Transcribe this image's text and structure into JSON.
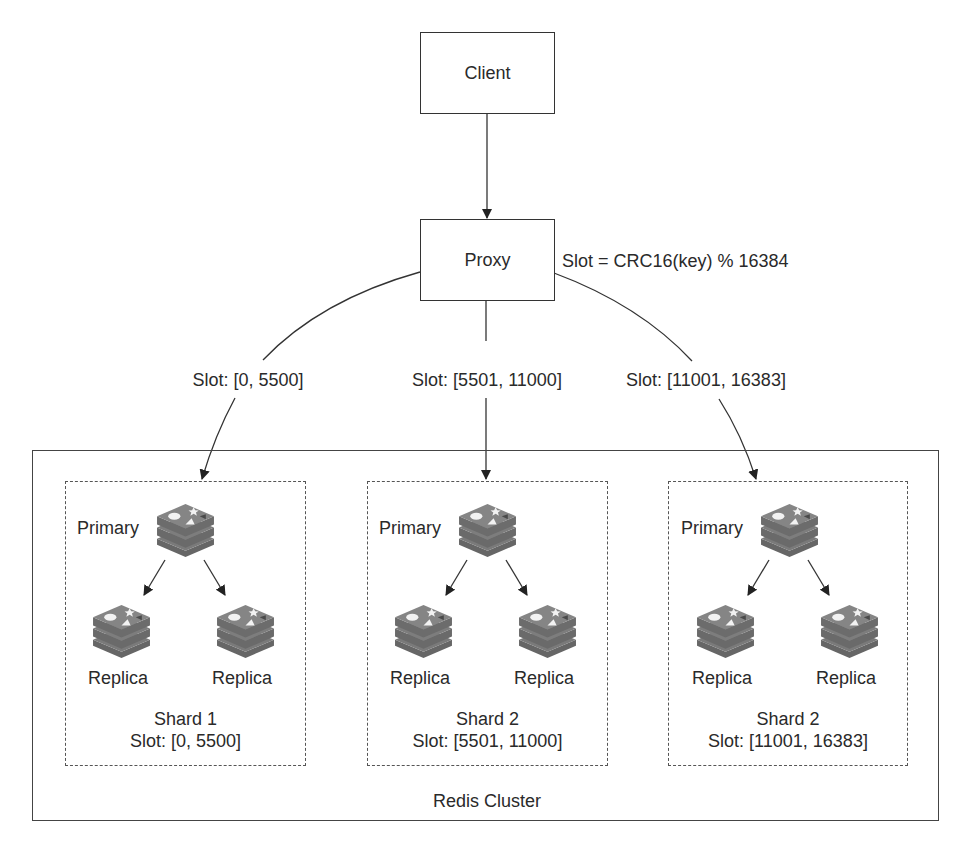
{
  "diagram": {
    "client": {
      "label": "Client"
    },
    "proxy": {
      "label": "Proxy",
      "hash_formula": "Slot = CRC16(key) % 16384"
    },
    "routes": [
      {
        "label": "Slot: [0, 5500]"
      },
      {
        "label": "Slot: [5501, 11000]"
      },
      {
        "label": "Slot: [11001, 16383]"
      }
    ],
    "cluster": {
      "label": "Redis Cluster",
      "shards": [
        {
          "name": "Shard 1",
          "slot": "Slot: [0, 5500]",
          "primary_label": "Primary",
          "replicas": [
            {
              "label": "Replica"
            },
            {
              "label": "Replica"
            }
          ]
        },
        {
          "name": "Shard 2",
          "slot": "Slot: [5501, 11000]",
          "primary_label": "Primary",
          "replicas": [
            {
              "label": "Replica"
            },
            {
              "label": "Replica"
            }
          ]
        },
        {
          "name": "Shard 2",
          "slot": "Slot: [11001, 16383]",
          "primary_label": "Primary",
          "replicas": [
            {
              "label": "Replica"
            },
            {
              "label": "Replica"
            }
          ]
        }
      ]
    },
    "icons": {
      "node": "redis-logo-icon"
    },
    "colors": {
      "line": "#333333",
      "icon": "#6b6b6b",
      "text": "#2a2a2a"
    }
  }
}
